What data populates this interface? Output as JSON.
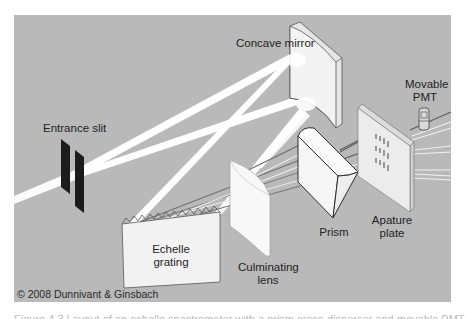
{
  "figure": {
    "background_color": "#b9b9b9",
    "beam_color": "#ffffff",
    "dispersed_ray_color": "#6e6e6e",
    "component_fill": "#f4f4f4",
    "outline_color": "#3a3a3a",
    "labels": {
      "concave_mirror": "Concave mirror",
      "movable_pmt_line1": "Movable",
      "movable_pmt_line2": "PMT",
      "entrance_slit": "Entrance slit",
      "echelle_grating_line1": "Echelle",
      "echelle_grating_line2": "grating",
      "culminating_lens_line1": "Culminating",
      "culminating_lens_line2": "lens",
      "prism": "Prism",
      "apature_plate_line1": "Apature",
      "apature_plate_line2": "plate"
    },
    "copyright": "© 2008 Dunnivant & Ginsbach",
    "caption_cropped": "Figure 4.3   Layout of an echelle spectrometer with a prism cross-disperser and movable PMT"
  }
}
